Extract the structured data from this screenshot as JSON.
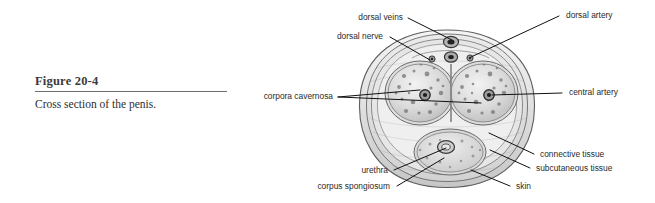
{
  "figure": {
    "number": "Figure 20-4",
    "caption": "Cross section of the penis."
  },
  "labels": {
    "dorsal_veins": "dorsal veins",
    "dorsal_nerve": "dorsal nerve",
    "dorsal_artery": "dorsal artery",
    "corpora_cavernosa": "corpora cavernosa",
    "central_artery": "central artery",
    "connective_tissue": "connective tissue",
    "subcutaneous_tissue": "subcutaneous tissue",
    "skin": "skin",
    "urethra": "urethra",
    "corpus_spongiosum": "corpus spongiosum"
  },
  "colors": {
    "background": "#ffffff",
    "leader_line": "#111111",
    "label_text": "#2b2b2b",
    "caption_title": "#3b3b3b",
    "caption_rule": "#6d6d6d",
    "tissue_light": "#e9e9e9",
    "tissue_mid": "#cfcfcf",
    "tissue_dark": "#9a9a9a",
    "outline": "#5a5a5a",
    "vessel_dark": "#2a2a2a"
  }
}
